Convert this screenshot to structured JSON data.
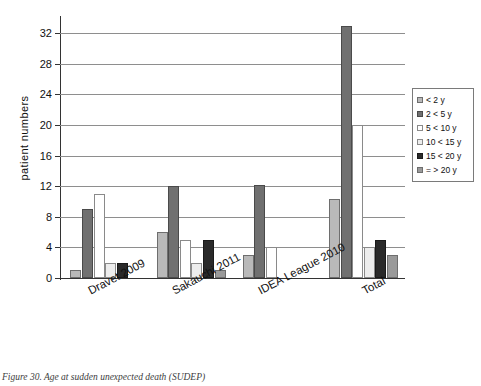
{
  "caption": "Figure 30. Age at sudden unexpected death (SUDEP)",
  "chart_data": {
    "type": "bar",
    "title": "",
    "xlabel": "",
    "ylabel": "patient  numbers",
    "ylim": [
      0,
      34
    ],
    "yticks": [
      0,
      4,
      8,
      12,
      16,
      20,
      24,
      28,
      32
    ],
    "ytick_labels": [
      "0",
      "4",
      "8",
      "12",
      "16",
      "20",
      "24",
      "28",
      "32"
    ],
    "grid": true,
    "legend_position": "right",
    "categories": [
      "Dravet 2009",
      "Sakauchi 2011",
      "IDEA League 2010",
      "Total"
    ],
    "series": [
      {
        "name": "< 2 y",
        "color": "#b9b9b9",
        "values": [
          1,
          6,
          3,
          10.3
        ]
      },
      {
        "name": "2 < 5 y",
        "color": "#707070",
        "values": [
          9,
          12,
          12.2,
          33
        ]
      },
      {
        "name": "5 < 10 y",
        "color": "#ffffff",
        "values": [
          11,
          5,
          4,
          20
        ]
      },
      {
        "name": "10 < 15 y",
        "color": "#ededed",
        "values": [
          2,
          2,
          0,
          4
        ]
      },
      {
        "name": "15 < 20 y",
        "color": "#2a2a2a",
        "values": [
          2,
          5,
          0,
          5
        ]
      },
      {
        "name": "= > 20 y",
        "color": "#9a9a9a",
        "values": [
          0,
          1,
          0,
          3
        ]
      }
    ]
  },
  "legend": {
    "items": [
      {
        "label": "< 2 y"
      },
      {
        "label": "2 < 5 y"
      },
      {
        "label": "5 < 10 y"
      },
      {
        "label": "10 < 15 y"
      },
      {
        "label": "15 < 20 y"
      },
      {
        "label": "= > 20 y"
      }
    ]
  }
}
